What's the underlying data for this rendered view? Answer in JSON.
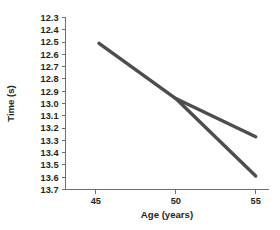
{
  "chart_data": {
    "type": "line",
    "title": "",
    "subtitle": "",
    "xlabel": "Age (years)",
    "ylabel": "Time (s)",
    "xlim": [
      43.1,
      55.8
    ],
    "ylim": [
      12.3,
      13.7
    ],
    "y_inverted": true,
    "grid": false,
    "legend": "none",
    "xticks": [
      45,
      50,
      55
    ],
    "xtick_labels": [
      "45",
      "50",
      "55"
    ],
    "yticks": [
      12.3,
      12.4,
      12.5,
      12.6,
      12.7,
      12.8,
      12.9,
      13.0,
      13.1,
      13.2,
      13.3,
      13.4,
      13.5,
      13.6,
      13.7
    ],
    "ytick_labels": [
      "12.3",
      "12.4",
      "12.5",
      "12.6",
      "12.7",
      "12.8",
      "12.9",
      "13.0",
      "13.1",
      "13.2",
      "13.3",
      "13.4",
      "13.5",
      "13.6",
      "13.7"
    ],
    "line_color": "#4d4d4f",
    "axis_color": "#6d6e71",
    "series": [
      {
        "name": "upper-branch",
        "x": [
          45.2,
          50.0,
          55.0
        ],
        "values": [
          12.51,
          12.96,
          13.27
        ]
      },
      {
        "name": "lower-branch",
        "x": [
          50.0,
          55.0
        ],
        "values": [
          12.96,
          13.59
        ]
      }
    ],
    "annotations": []
  }
}
